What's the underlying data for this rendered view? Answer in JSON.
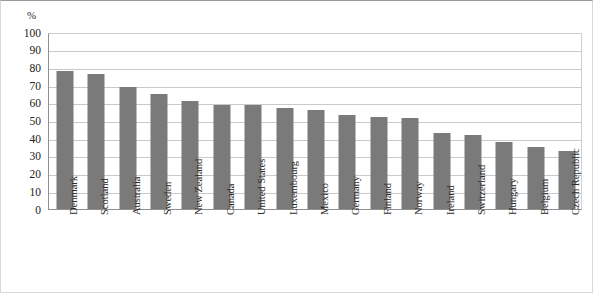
{
  "chart_data": {
    "type": "bar",
    "title": "",
    "subtitle": "",
    "xlabel": "",
    "ylabel": "%",
    "unit_label": "%",
    "ylim": [
      0,
      100
    ],
    "ytick_step": 10,
    "yticks": [
      "100",
      "90",
      "80",
      "70",
      "60",
      "50",
      "40",
      "30",
      "20",
      "10",
      "0"
    ],
    "grid": true,
    "legend": false,
    "legend_position": "none",
    "bar_color": "#7a7a7a",
    "gridline_color": "#c9c9c9",
    "axis_color": "#8f8f8f",
    "categories": [
      "Denmark",
      "Scotland",
      "Australia",
      "Sweden",
      "New Zealand",
      "Canada",
      "United States",
      "Luxembourg",
      "Mexico",
      "Germany",
      "Finland",
      "Norway",
      "Ireland",
      "Switzerland",
      "Hungary",
      "Belgium",
      "Czech Republic"
    ],
    "values": [
      78,
      76.5,
      69,
      65,
      61,
      58.5,
      58.5,
      57,
      56,
      53,
      52,
      51.5,
      43,
      42,
      38,
      35,
      33
    ]
  }
}
